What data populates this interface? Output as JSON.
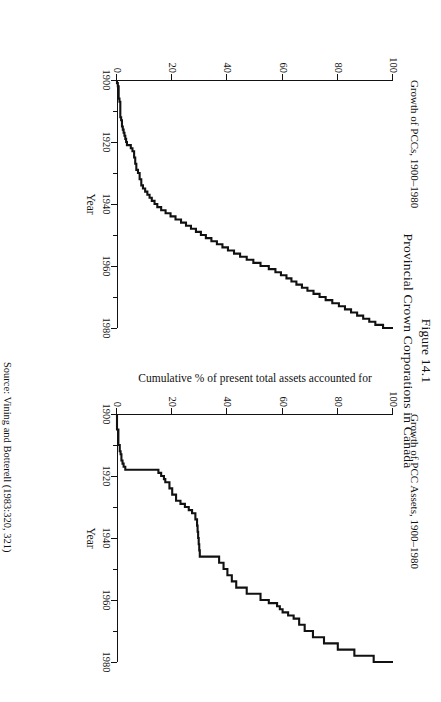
{
  "figure": {
    "number": "Figure 14.1",
    "title": "Provincial Crown Corporations in Canada",
    "source": "Source: Vining and Botterell (1983:320, 321)"
  },
  "axis": {
    "x_title": "Year",
    "y_title": "Cumulative % of present total assets accounted for",
    "x_ticks": [
      "1900",
      "1920",
      "1940",
      "1960",
      "1980"
    ],
    "y_ticks": [
      "0",
      "20",
      "40",
      "60",
      "80",
      "100"
    ]
  },
  "panels": [
    {
      "key": "pccs",
      "caption": "Growth of PCCs, 1900–1980"
    },
    {
      "key": "assets",
      "caption": "Growth of PCC Assets, 1900–1980"
    }
  ],
  "chart_data": [
    {
      "type": "line",
      "id": "growth-of-pccs",
      "title": "Growth of PCCs, 1900–1980",
      "xlabel": "Year",
      "ylabel": "Cumulative % of present total assets accounted for",
      "xlim": [
        1900,
        1980
      ],
      "ylim": [
        0,
        100
      ],
      "xticks": [
        1900,
        1920,
        1940,
        1960,
        1980
      ],
      "yticks": [
        0,
        20,
        40,
        60,
        80,
        100
      ],
      "grid": false,
      "legend": "none",
      "series": [
        {
          "name": "Cumulative % of PCCs",
          "x": [
            1900,
            1901,
            1902,
            1906,
            1907,
            1912,
            1913,
            1915,
            1916,
            1917,
            1918,
            1919,
            1920,
            1921,
            1922,
            1923,
            1925,
            1927,
            1929,
            1930,
            1932,
            1934,
            1935,
            1936,
            1937,
            1938,
            1939,
            1940,
            1941,
            1942,
            1943,
            1944,
            1945,
            1946,
            1947,
            1948,
            1949,
            1950,
            1951,
            1952,
            1953,
            1954,
            1955,
            1956,
            1957,
            1958,
            1959,
            1960,
            1961,
            1962,
            1963,
            1964,
            1965,
            1966,
            1967,
            1968,
            1969,
            1970,
            1971,
            1972,
            1973,
            1974,
            1975,
            1976,
            1977,
            1978,
            1979,
            1980
          ],
          "y": [
            0,
            0.3,
            0.6,
            0.9,
            1.2,
            1.5,
            1.8,
            2.1,
            2.4,
            2.7,
            3.0,
            3.3,
            3.6,
            5.0,
            5.6,
            6.2,
            6.6,
            7.0,
            7.6,
            8.2,
            8.8,
            9.4,
            10.2,
            11.0,
            11.8,
            12.6,
            13.6,
            14.6,
            16.0,
            17.6,
            19.4,
            21.2,
            23.2,
            25.0,
            26.8,
            28.6,
            30.4,
            32.2,
            34.2,
            36.2,
            38.2,
            40.2,
            42.4,
            44.6,
            47.0,
            49.4,
            52.0,
            55.0,
            57.4,
            59.4,
            61.4,
            63.2,
            65.0,
            67.0,
            69.0,
            71.2,
            73.4,
            75.6,
            78.0,
            80.4,
            82.6,
            84.8,
            87.0,
            89.2,
            91.4,
            93.6,
            96.4,
            100
          ]
        }
      ]
    },
    {
      "type": "line",
      "id": "growth-of-pcc-assets",
      "title": "Growth of PCC Assets, 1900–1980",
      "xlabel": "Year",
      "ylabel": "Cumulative % of present total assets accounted for",
      "xlim": [
        1900,
        1980
      ],
      "ylim": [
        0,
        100
      ],
      "xticks": [
        1900,
        1920,
        1940,
        1960,
        1980
      ],
      "yticks": [
        0,
        20,
        40,
        60,
        80,
        100
      ],
      "grid": false,
      "legend": "none",
      "series": [
        {
          "name": "Cumulative % of present total assets",
          "x": [
            1900,
            1905,
            1910,
            1912,
            1913,
            1915,
            1916,
            1917,
            1918,
            1919,
            1920,
            1921,
            1922,
            1924,
            1926,
            1928,
            1929,
            1930,
            1931,
            1932,
            1934,
            1936,
            1938,
            1940,
            1942,
            1944,
            1946,
            1948,
            1950,
            1952,
            1954,
            1956,
            1958,
            1960,
            1961,
            1962,
            1963,
            1964,
            1965,
            1966,
            1968,
            1970,
            1972,
            1974,
            1976,
            1978,
            1980
          ],
          "y": [
            0,
            0.5,
            1.0,
            1.3,
            1.6,
            2.0,
            2.4,
            3.0,
            15.0,
            16.0,
            17.0,
            17.5,
            19.0,
            20.0,
            21.4,
            23.0,
            24.6,
            26.0,
            27.2,
            28.4,
            29.0,
            29.2,
            29.4,
            29.6,
            29.8,
            30.0,
            37.0,
            38.6,
            40.0,
            41.6,
            43.2,
            47.0,
            52.0,
            55.0,
            58.0,
            59.0,
            60.0,
            62.0,
            64.0,
            66.0,
            68.0,
            71.0,
            75.0,
            80.0,
            86.0,
            93.0,
            100
          ]
        }
      ]
    }
  ]
}
